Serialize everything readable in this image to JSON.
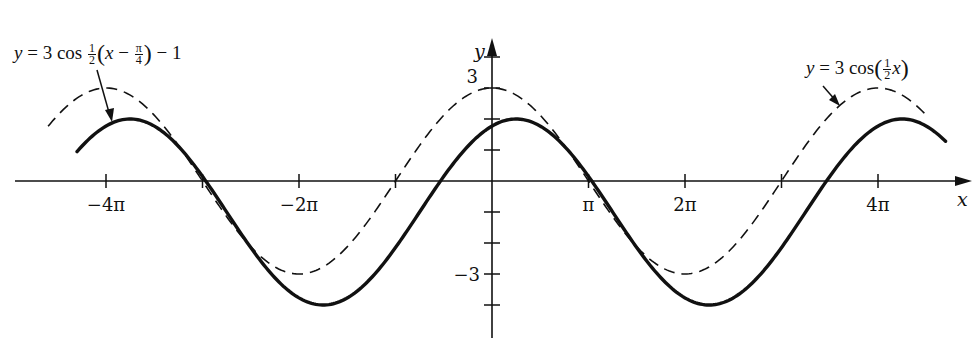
{
  "chart_data": {
    "type": "line",
    "title": "",
    "xlabel": "x",
    "ylabel": "y",
    "x_tick_labels": [
      "-4π",
      "-2π",
      "π",
      "2π",
      "4π"
    ],
    "x_tick_values_in_pi": [
      -4,
      -3,
      -2,
      -1,
      1,
      2,
      3,
      4
    ],
    "x_labeled_ticks_in_pi": [
      -4,
      -2,
      1,
      2,
      4
    ],
    "y_tick_labels": [
      "3",
      "-3"
    ],
    "y_tick_values": [
      -4,
      -3,
      -2,
      -1,
      1,
      2,
      3,
      4
    ],
    "xlim_in_pi": [
      -4.9,
      4.9
    ],
    "ylim": [
      -4.6,
      4.6
    ],
    "grid": false,
    "legend": "inline annotations with arrows",
    "series": [
      {
        "name": "y = 3 cos(½x)",
        "style": "dashed",
        "formula": "3*cos(x/2)",
        "x_range_in_pi": [
          -4.6,
          4.5
        ],
        "amplitude": 3,
        "vertical_shift": 0,
        "phase_shift": 0,
        "period_in_pi": 4,
        "key_points": [
          {
            "x": "-4π",
            "y": 3
          },
          {
            "x": "-3π",
            "y": 0
          },
          {
            "x": "-2π",
            "y": -3
          },
          {
            "x": "-π",
            "y": 0
          },
          {
            "x": "0",
            "y": 3
          },
          {
            "x": "π",
            "y": 0
          },
          {
            "x": "2π",
            "y": -3
          },
          {
            "x": "3π",
            "y": 0
          },
          {
            "x": "4π",
            "y": 3
          }
        ]
      },
      {
        "name": "y = 3 cos ½(x − π/4) − 1",
        "style": "solid",
        "formula": "3*cos((x - pi/4)/2) - 1",
        "x_range_in_pi": [
          -4.3,
          4.7
        ],
        "amplitude": 3,
        "vertical_shift": -1,
        "phase_shift_in_pi": 0.25,
        "period_in_pi": 4,
        "key_points": [
          {
            "x": "-3.75π",
            "y": 2
          },
          {
            "x": "-1.75π",
            "y": -4
          },
          {
            "x": "0.25π",
            "y": 2
          },
          {
            "x": "2.25π",
            "y": -4
          },
          {
            "x": "4.25π",
            "y": 2
          }
        ]
      }
    ]
  },
  "annotations": {
    "left_eq": {
      "y": "y",
      "eq": "=",
      "coef": "3 cos",
      "num": "1",
      "den": "2",
      "x": "x",
      "minus": "−",
      "pi": "π",
      "four": "4",
      "tail": "− 1"
    },
    "right_eq": {
      "y": "y",
      "eq": "=",
      "coef": "3 cos",
      "num": "1",
      "den": "2",
      "x": "x"
    }
  },
  "axes": {
    "x_label": "x",
    "y_label": "y",
    "x_ticks": [
      {
        "label": "−4π",
        "pos": -4
      },
      {
        "label": "−2π",
        "pos": -2
      },
      {
        "label": "π",
        "pos": 1
      },
      {
        "label": "2π",
        "pos": 2
      },
      {
        "label": "4π",
        "pos": 4
      }
    ],
    "y_ticks": [
      {
        "label": "3",
        "pos": 3
      },
      {
        "label": "−3",
        "pos": -3
      }
    ]
  },
  "layout": {
    "origin_x": 492,
    "origin_y": 181,
    "px_per_pi": 96.5,
    "px_per_unit": 31,
    "stroke_color": "#111111"
  }
}
